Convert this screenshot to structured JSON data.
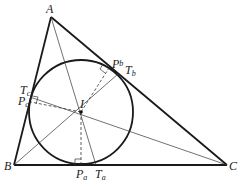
{
  "diagram": {
    "type": "triangle-incircle",
    "colors": {
      "stroke": "#1a1a1a",
      "background": "#ffffff"
    },
    "points": {
      "A": {
        "label": "A",
        "x": 51,
        "y": 17
      },
      "B": {
        "label": "B",
        "x": 14,
        "y": 165
      },
      "C": {
        "label": "C",
        "x": 227,
        "y": 165
      },
      "I": {
        "label": "I",
        "x": 81,
        "y": 112
      },
      "Pa": {
        "label": "P",
        "sub": "a",
        "x": 81,
        "y": 165
      },
      "Ta": {
        "label": "T",
        "sub": "a",
        "x": 96,
        "y": 165
      },
      "Pb": {
        "label": "P",
        "sub": "b",
        "x": 109,
        "y": 68
      },
      "Tb": {
        "label": "T",
        "sub": "b",
        "x": 118,
        "y": 74
      },
      "Pc": {
        "label": "P",
        "sub": "c",
        "x": 30,
        "y": 102
      },
      "Tc": {
        "label": "T",
        "sub": "c",
        "x": 30,
        "y": 96
      }
    },
    "circle": {
      "cx": 81,
      "cy": 112,
      "r": 52
    },
    "labels": {
      "A": "A",
      "B": "B",
      "C": "C",
      "I": "I",
      "P": "P",
      "T": "T",
      "a": "a",
      "b": "b",
      "c": "c"
    }
  }
}
